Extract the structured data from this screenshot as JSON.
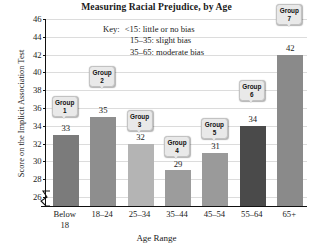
{
  "chart_data": {
    "type": "bar",
    "title": "Measuring Racial Prejudice, by Age",
    "xlabel": "Age Range",
    "ylabel": "Score on the Implicit Association Test",
    "categories": [
      "Below 18",
      "18–24",
      "25–34",
      "35–44",
      "45–54",
      "55–64",
      "65+"
    ],
    "category_lines": [
      [
        "Below",
        "18"
      ],
      [
        "18–24"
      ],
      [
        "25–34"
      ],
      [
        "35–44"
      ],
      [
        "45–54"
      ],
      [
        "55–64"
      ],
      [
        "65+"
      ]
    ],
    "values": [
      33,
      35,
      32,
      29,
      31,
      34,
      42
    ],
    "point_labels": [
      "Group 1",
      "Group 2",
      "Group 3",
      "Group 4",
      "Group 5",
      "Group 6",
      "Group 7"
    ],
    "group_names": [
      "Group",
      "Group",
      "Group",
      "Group",
      "Group",
      "Group",
      "Group"
    ],
    "group_numbers": [
      "1",
      "2",
      "3",
      "4",
      "5",
      "6",
      "7"
    ],
    "bar_colors": [
      "#7b7b7b",
      "#8e8e8e",
      "#b4b4b4",
      "#9c9c9c",
      "#9a9a9a",
      "#4a4a4a",
      "#8a8a8a"
    ],
    "ylim": [
      25,
      46
    ],
    "yticks": [
      26,
      28,
      30,
      32,
      34,
      36,
      38,
      40,
      42,
      44,
      46
    ],
    "ytick_labels": [
      "26",
      "28",
      "30",
      "32",
      "34",
      "36",
      "38",
      "40",
      "42",
      "44",
      "46"
    ],
    "grid": true,
    "axis_break": true,
    "legend_position": "inside-top-center",
    "annotations": [
      "Key:   <15: little or no bias",
      "15–35: slight bias",
      "35–65: moderate bias"
    ]
  },
  "key": {
    "title": "Key:",
    "lines": [
      "<15: little or no bias",
      "15–35: slight bias",
      "35–65: moderate bias"
    ]
  },
  "colors": {
    "grid": "#dcdcdc",
    "axis": "#111111",
    "callout_fill": "#e9e9e9",
    "callout_border": "#c2c2c2",
    "text": "#1a1a1a"
  }
}
